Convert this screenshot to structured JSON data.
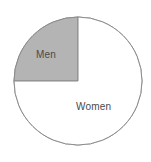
{
  "chart_data": {
    "type": "pie",
    "title": "",
    "subtitle": "",
    "xlabel": "",
    "ylabel": "",
    "legend_position": "none",
    "grid": false,
    "labels_inside_slices": true,
    "categories": [
      "Men",
      "Women"
    ],
    "values": [
      25,
      75
    ],
    "units": "percent",
    "slices": [
      {
        "label": "Men",
        "value": 25,
        "fraction": 0.25,
        "start_angle_deg": 0,
        "end_angle_deg": 90,
        "sweep": "counterclockwise-from-top",
        "quadrant": "upper-left",
        "fill": "#b4b4b4",
        "stroke": "#8a8a8a",
        "label_color": "#4a4a4a"
      },
      {
        "label": "Women",
        "value": 75,
        "fraction": 0.75,
        "start_angle_deg": 90,
        "end_angle_deg": 360,
        "sweep": "counterclockwise-from-left",
        "quadrant": "remaining-three-quarters",
        "fill": "#ffffff",
        "stroke": "#8a8a8a",
        "label_color": "#4a4a4a"
      }
    ]
  },
  "figure": {
    "background": "#ffffff",
    "outline_color": "#8a8a8a",
    "center_x": 78,
    "center_y": 81,
    "radius": 64
  },
  "labels": {
    "men": "Men",
    "women": "Women"
  }
}
